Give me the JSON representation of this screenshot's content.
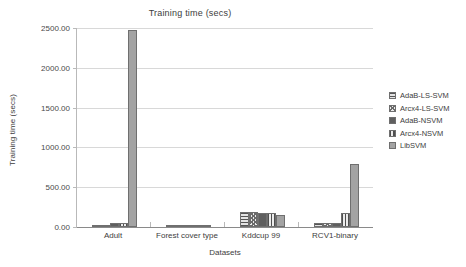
{
  "chart_data": {
    "type": "bar",
    "title": "Training time (secs)",
    "xlabel": "Datasets",
    "ylabel": "Training time (secs)",
    "categories": [
      "Adult",
      "Forest cover type",
      "Kddcup 99",
      "RCV1-binary"
    ],
    "ylim": [
      0,
      2500
    ],
    "ytick_step": 500,
    "ytick_labels": [
      "0.00",
      "500.00",
      "1000.00",
      "1500.00",
      "2000.00",
      "2500.00"
    ],
    "ytick_values": [
      0,
      500,
      1000,
      1500,
      2000,
      2500
    ],
    "grid": true,
    "legend_position": "right",
    "series": [
      {
        "name": "AdaB-LS-SVM",
        "pattern": "horizontal-lines",
        "color": "#e4e4e4",
        "values": [
          12,
          8,
          190,
          55
        ]
      },
      {
        "name": "Arcx4-LS-SVM",
        "pattern": "checkered",
        "color": "#ededed",
        "values": [
          14,
          9,
          185,
          48
        ]
      },
      {
        "name": "AdaB-NSVM",
        "pattern": "solid-dark",
        "color": "#5f5f5f",
        "values": [
          45,
          18,
          175,
          50
        ]
      },
      {
        "name": "Arcx4-NSVM",
        "pattern": "vertical-lines",
        "color": "#ececec",
        "values": [
          50,
          30,
          170,
          180
        ]
      },
      {
        "name": "LibSVM",
        "pattern": "solid-gray",
        "color": "#a3a3a3",
        "values": [
          2470,
          20,
          155,
          795
        ]
      }
    ]
  }
}
